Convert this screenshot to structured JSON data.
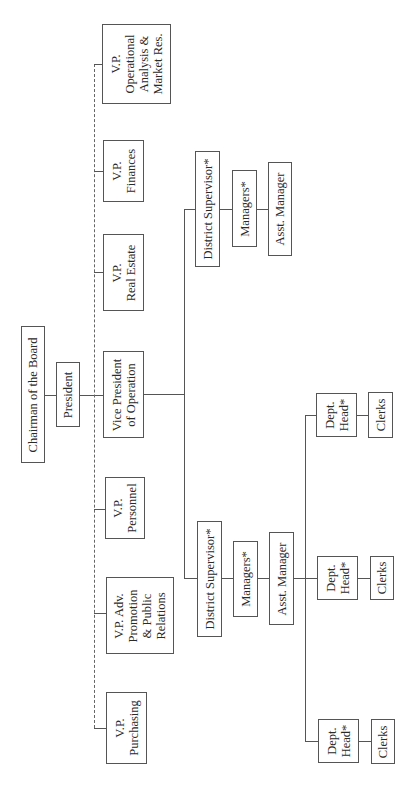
{
  "chart_title": "",
  "nodes": {
    "chairman": "Chairman of the Board",
    "president": "President",
    "vp_operational": "V.P.\nOperational\nAnalysis &\nMarket Res.",
    "vp_finances": "V.P.\nFinances",
    "vp_real_estate": "V.P.\nReal Estate",
    "vp_operation": "Vice President\nof Operation",
    "vp_personnel": "V.P.\nPersonnel",
    "vp_adv": "V.P. Adv.\nPromotion\n& Public\nRelations",
    "vp_purchasing": "V.P.\nPurchasing",
    "ds_right": "District Supervisor*",
    "mgr_right": "Managers*",
    "asst_right": "Asst. Manager",
    "ds_left": "District Supervisor*",
    "mgr_left": "Managers*",
    "asst_left": "Asst. Manager",
    "dh_1": "Dept.\nHead*",
    "clerks_1": "Clerks",
    "dh_2": "Dept.\nHead*",
    "clerks_2": "Clerks",
    "dh_3": "Dept.\nHead*",
    "clerks_3": "Clerks"
  },
  "orientation": "rotated 90° counter-clockwise (text reads bottom-to-top)"
}
